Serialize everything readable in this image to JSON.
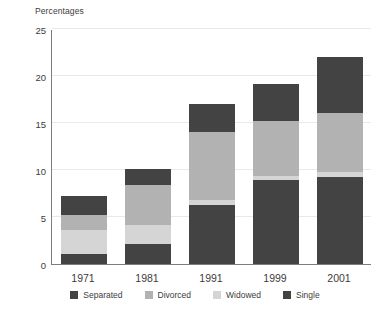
{
  "chart_data": {
    "type": "bar",
    "subtype": "stacked-vertical",
    "title": "",
    "ylabel": "Percentages",
    "xlabel": "",
    "categories": [
      "1971",
      "1981",
      "1991",
      "1999",
      "2001"
    ],
    "ylim": [
      0,
      25
    ],
    "yticks": [
      0,
      5,
      10,
      15,
      20,
      25
    ],
    "grid": true,
    "grid_axis": "y",
    "legend_position": "bottom",
    "stack_order_bottom_to_top": [
      "Single",
      "Widowed",
      "Divorced",
      "Separated"
    ],
    "series": [
      {
        "name": "Single",
        "color": "#434343",
        "values": [
          1.1,
          2.1,
          6.3,
          8.9,
          9.3
        ]
      },
      {
        "name": "Widowed",
        "color": "#d5d5d5",
        "values": [
          2.5,
          2.1,
          0.5,
          0.5,
          0.5
        ]
      },
      {
        "name": "Divorced",
        "color": "#b2b2b2",
        "values": [
          1.6,
          4.2,
          7.2,
          5.8,
          6.3
        ]
      },
      {
        "name": "Separated",
        "color": "#434343",
        "values": [
          2.0,
          1.7,
          3.0,
          3.9,
          5.9
        ]
      }
    ],
    "totals": [
      7.2,
      10.1,
      17.0,
      19.1,
      22.1
    ]
  },
  "axis": {
    "y_title": "Percentages",
    "y_tick_labels": [
      "25",
      "20",
      "15",
      "10",
      "5",
      "0"
    ],
    "x_tick_labels": [
      "1971",
      "1981",
      "1991",
      "1999",
      "2001"
    ]
  },
  "legend": {
    "items": [
      {
        "label": "Separated",
        "color": "#434343"
      },
      {
        "label": "Divorced",
        "color": "#b2b2b2"
      },
      {
        "label": "Widowed",
        "color": "#d5d5d5"
      },
      {
        "label": "Single",
        "color": "#434343"
      }
    ]
  }
}
